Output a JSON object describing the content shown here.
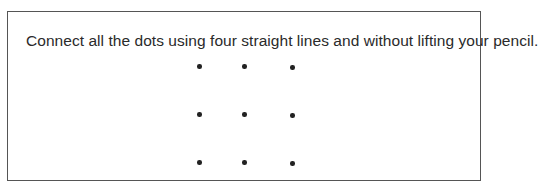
{
  "puzzle": {
    "instruction": "Connect all the dots using four straight lines and without lifting your pencil.",
    "grid": {
      "rows": 3,
      "cols": 3,
      "dots": [
        {
          "row": 0,
          "col": 0
        },
        {
          "row": 0,
          "col": 1
        },
        {
          "row": 0,
          "col": 2
        },
        {
          "row": 1,
          "col": 0
        },
        {
          "row": 1,
          "col": 1
        },
        {
          "row": 1,
          "col": 2
        },
        {
          "row": 2,
          "col": 0
        },
        {
          "row": 2,
          "col": 1
        },
        {
          "row": 2,
          "col": 2
        }
      ]
    }
  }
}
